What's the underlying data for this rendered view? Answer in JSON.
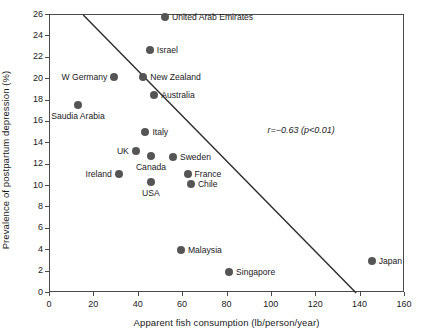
{
  "chart_data": {
    "type": "scatter",
    "title": "",
    "xlabel": "Apparent fish consumption (lb/person/year)",
    "ylabel": "Prevalence of postpartum depression (%)",
    "xlim": [
      0,
      160
    ],
    "ylim": [
      0,
      26
    ],
    "xticks": [
      0,
      20,
      40,
      60,
      80,
      100,
      120,
      140,
      160
    ],
    "yticks": [
      0,
      2,
      4,
      6,
      8,
      10,
      12,
      14,
      16,
      18,
      20,
      22,
      24,
      26
    ],
    "grid": false,
    "legend": "none",
    "marker_color": "#555555",
    "annotations": [
      {
        "text": "r=−0.63 (p<0.01)",
        "x": 98,
        "y": 15.7
      }
    ],
    "trendline": {
      "type": "line",
      "x": [
        15,
        138
      ],
      "y": [
        26,
        0
      ],
      "color": "#2b2b2b"
    },
    "points": [
      {
        "label": "United Arab Emirates",
        "x": 51.8,
        "y": 25.8,
        "label_pos": "right"
      },
      {
        "label": "Israel",
        "x": 45.0,
        "y": 22.7,
        "label_pos": "right"
      },
      {
        "label": "W Germany",
        "x": 29.0,
        "y": 20.2,
        "label_pos": "left"
      },
      {
        "label": "New Zealand",
        "x": 42.0,
        "y": 20.2,
        "label_pos": "right"
      },
      {
        "label": "Australia",
        "x": 47.0,
        "y": 18.5,
        "label_pos": "right"
      },
      {
        "label": "Saudia Arabia",
        "x": 12.6,
        "y": 17.6,
        "label_pos": "below"
      },
      {
        "label": "Italy",
        "x": 43.0,
        "y": 15.1,
        "label_pos": "right"
      },
      {
        "label": "UK",
        "x": 38.7,
        "y": 13.3,
        "label_pos": "left"
      },
      {
        "label": "Canada",
        "x": 45.5,
        "y": 12.8,
        "label_pos": "below"
      },
      {
        "label": "Sweden",
        "x": 55.4,
        "y": 12.7,
        "label_pos": "right"
      },
      {
        "label": "Ireland",
        "x": 31.0,
        "y": 11.1,
        "label_pos": "left"
      },
      {
        "label": "France",
        "x": 62.0,
        "y": 11.1,
        "label_pos": "right"
      },
      {
        "label": "Chile",
        "x": 63.5,
        "y": 10.2,
        "label_pos": "right"
      },
      {
        "label": "USA",
        "x": 45.5,
        "y": 10.4,
        "label_pos": "below"
      },
      {
        "label": "Malaysia",
        "x": 59.0,
        "y": 4.0,
        "label_pos": "right"
      },
      {
        "label": "Singapore",
        "x": 80.7,
        "y": 2.0,
        "label_pos": "right"
      },
      {
        "label": "Japan",
        "x": 145.0,
        "y": 3.0,
        "label_pos": "right"
      }
    ]
  }
}
